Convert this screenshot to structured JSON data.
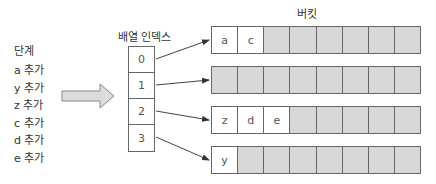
{
  "title": "버킷",
  "steps": {
    "title": "단계",
    "items": [
      "a 추가",
      "y 추가",
      "z 추가",
      "c 추가",
      "d 추가",
      "e 추가"
    ]
  },
  "index_array": {
    "title": "배열 인덱스",
    "cells": [
      "0",
      "1",
      "2",
      "3"
    ]
  },
  "buckets": [
    {
      "index": "0",
      "cells": [
        "a",
        "c",
        "",
        "",
        "",
        "",
        "",
        ""
      ]
    },
    {
      "index": "1",
      "cells": [
        "",
        "",
        "",
        "",
        "",
        "",
        "",
        ""
      ]
    },
    {
      "index": "2",
      "cells": [
        "z",
        "d",
        "e",
        "",
        "",
        "",
        "",
        ""
      ]
    },
    {
      "index": "3",
      "cells": [
        "y",
        "",
        "",
        "",
        "",
        "",
        "",
        ""
      ]
    }
  ],
  "colors": {
    "empty_cell": "#d8d8d8",
    "filled_cell": "#ffffff",
    "border": "#666666",
    "arrow_fill": "#dcdcdc"
  }
}
